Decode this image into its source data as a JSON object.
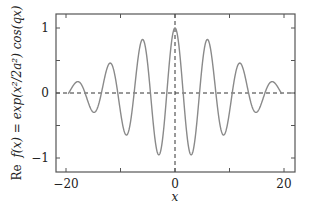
{
  "chart_data": {
    "type": "line",
    "title": "",
    "xlabel": "x",
    "ylabel": "Re f(x) = exp(x²/2a²) cos(qx)",
    "xlim": [
      -21.8,
      22.0
    ],
    "ylim": [
      -1.2,
      1.2
    ],
    "xticks": [
      -20,
      0,
      20
    ],
    "xtick_labels": [
      "−20",
      "0",
      "20"
    ],
    "x_minor_ticks": [
      -10,
      10
    ],
    "yticks": [
      -1,
      0,
      1
    ],
    "ytick_labels": [
      "−1",
      "0",
      "1"
    ],
    "y_minor_ticks": [
      -0.5,
      0.5
    ],
    "grid": false,
    "legend": null,
    "reference_lines": [
      {
        "orientation": "horizontal",
        "value": 0,
        "style": "dashed"
      },
      {
        "orientation": "vertical",
        "value": 0,
        "style": "dashed"
      }
    ],
    "series": [
      {
        "name": "Re f(x)",
        "color": "#8a8a8a",
        "function": "exp(-x^2/(2a^2))*cos(q*x)",
        "params": {
          "a": 9.6,
          "q": 1.047
        },
        "x_range": [
          -19.6,
          19.6
        ],
        "key_points": {
          "x": [
            -18,
            -15,
            -12,
            -9,
            -6,
            -3,
            0,
            3,
            6,
            9,
            12,
            15,
            18
          ],
          "y": [
            0.17,
            -0.3,
            0.46,
            -0.66,
            0.82,
            -0.93,
            1.0,
            -0.93,
            0.82,
            -0.66,
            0.46,
            -0.3,
            0.17
          ]
        }
      }
    ]
  },
  "labels": {
    "xlabel": "x",
    "ylabel_re": "Re",
    "ylabel_expr": "f(x) = exp(x²/2a²) cos(qx)",
    "xtick_m20": "−20",
    "xtick_0": "0",
    "xtick_20": "20",
    "ytick_1": "1",
    "ytick_0": "0",
    "ytick_m1": "−1"
  },
  "colors": {
    "curve": "#8a8a8a",
    "frame": "#555555",
    "dashed": "#333333"
  }
}
